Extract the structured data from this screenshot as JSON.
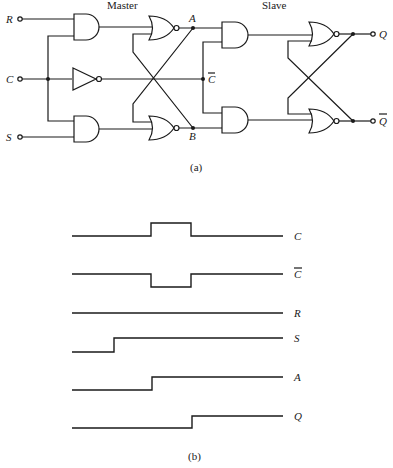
{
  "circuit": {
    "master_label": "Master",
    "slave_label": "Slave",
    "inputs": {
      "R": "R",
      "C": "C",
      "S": "S"
    },
    "nodes": {
      "A": "A",
      "B": "B",
      "C_bar": "C"
    },
    "outputs": {
      "Q": "Q",
      "Q_bar": "Q"
    },
    "caption": "(a)"
  },
  "timing": {
    "caption": "(b)",
    "signals": [
      {
        "name": "C",
        "overbar": false
      },
      {
        "name": "C",
        "overbar": true
      },
      {
        "name": "R",
        "overbar": false
      },
      {
        "name": "S",
        "overbar": false
      },
      {
        "name": "A",
        "overbar": false
      },
      {
        "name": "Q",
        "overbar": false
      }
    ]
  }
}
